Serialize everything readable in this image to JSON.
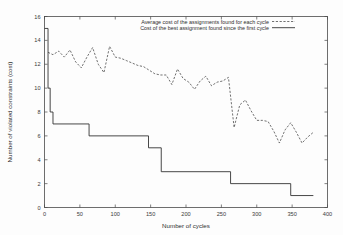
{
  "chart_data": {
    "type": "line",
    "title": "",
    "xlabel": "Number of cycles",
    "ylabel": "Number of violated constraints (cost)",
    "xlim": [
      0,
      400
    ],
    "ylim": [
      0,
      16
    ],
    "xticks": [
      0,
      50,
      100,
      150,
      200,
      250,
      300,
      350,
      400
    ],
    "xtick_labels": [
      "0",
      "50",
      "100",
      "150",
      "200",
      "250",
      "300",
      "350",
      "400"
    ],
    "yticks": [
      0,
      2,
      4,
      6,
      8,
      10,
      12,
      14,
      16
    ],
    "ytick_labels": [
      "0",
      "2",
      "4",
      "6",
      "8",
      "10",
      "12",
      "14",
      "16"
    ],
    "grid": false,
    "legend_position": "top-center-right-inside",
    "series": [
      {
        "name": "Average cost of the assignments found for each cycle",
        "style": "dashed",
        "color": "#333333",
        "x": [
          5,
          12,
          20,
          28,
          36,
          44,
          52,
          60,
          68,
          76,
          84,
          92,
          100,
          108,
          116,
          124,
          132,
          140,
          148,
          156,
          164,
          172,
          180,
          188,
          196,
          204,
          212,
          220,
          228,
          236,
          244,
          252,
          260,
          268,
          276,
          284,
          292,
          300,
          308,
          316,
          324,
          332,
          340,
          348,
          356,
          364,
          372,
          380
        ],
        "values": [
          13.0,
          12.8,
          13.1,
          12.6,
          13.2,
          12.2,
          11.7,
          12.6,
          13.4,
          12.0,
          11.3,
          13.5,
          12.6,
          12.5,
          12.3,
          12.1,
          11.9,
          11.8,
          11.5,
          11.2,
          11.1,
          11.1,
          10.3,
          11.6,
          10.8,
          10.5,
          9.9,
          10.6,
          11.0,
          10.2,
          10.5,
          10.6,
          10.9,
          6.7,
          8.6,
          9.0,
          8.1,
          7.3,
          7.3,
          7.2,
          6.4,
          5.4,
          6.5,
          7.1,
          6.3,
          5.4,
          5.9,
          6.3
        ]
      },
      {
        "name": "Cost of the best assignment found since the first cycle",
        "style": "solid-step",
        "color": "#333333",
        "steps": [
          {
            "x": 0,
            "value": 15
          },
          {
            "x": 5,
            "value": 10
          },
          {
            "x": 8,
            "value": 8
          },
          {
            "x": 12,
            "value": 7
          },
          {
            "x": 63,
            "value": 6
          },
          {
            "x": 147,
            "value": 5
          },
          {
            "x": 165,
            "value": 3
          },
          {
            "x": 263,
            "value": 2
          },
          {
            "x": 348,
            "value": 1
          },
          {
            "x": 380,
            "value": 1
          }
        ]
      }
    ]
  },
  "legend": {
    "entries": [
      {
        "label": "Average cost of the assignments found for each cycle",
        "style": "dashed"
      },
      {
        "label": "Cost of the best assignment found since the first cycle",
        "style": "solid"
      }
    ]
  }
}
